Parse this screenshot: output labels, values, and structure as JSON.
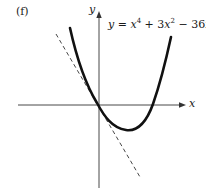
{
  "figure": {
    "panel_label": "(f)",
    "y_axis_label": "y",
    "x_axis_label": "x",
    "equation": {
      "lhs": "y",
      "eq": " = ",
      "t1_var": "x",
      "t1_exp": "4",
      "op1": " + 3",
      "t2_var": "x",
      "t2_exp": "2",
      "op2": " − 36",
      "t3_var": "x",
      "full_text": "y = x^4 + 3x^2 − 36x"
    },
    "curve": {
      "description": "y = x^4 + 3x^2 - 36x",
      "style": "solid bold"
    },
    "tangent": {
      "description": "tangent line at origin, slope -36",
      "style": "dashed"
    },
    "colors": {
      "ink": "#1a1a1a",
      "background": "#ffffff"
    }
  }
}
